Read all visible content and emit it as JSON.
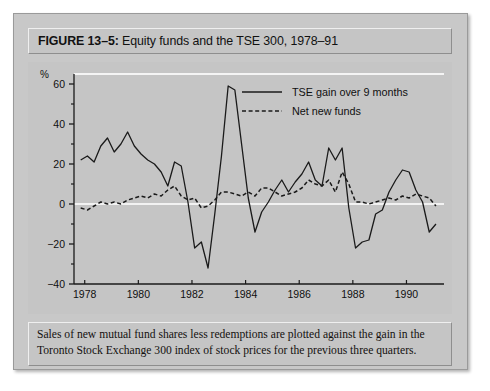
{
  "figure": {
    "label": "FIGURE 13–5:",
    "title": " Equity funds and the TSE 300, 1978–91",
    "full_title": "FIGURE 13–5: Equity funds and the TSE 300, 1978–91",
    "caption": "Sales of new mutual fund shares less redemptions are plotted against the gain in the Toronto Stock Exchange 300 index of stock prices for the previous three quarters."
  },
  "colors": {
    "panel_background": "#c8c8c8",
    "plot_background": "#c5c5c5",
    "line": "#1a1a1a",
    "zero_line": "#f2f2f2",
    "text": "#111111"
  },
  "chart_data": {
    "type": "line",
    "title": "Equity funds and the TSE 300, 1978–91",
    "xlabel": "",
    "ylabel": "%",
    "unit_label": "%",
    "xlim": [
      1977.6,
      1991.4
    ],
    "ylim": [
      -40,
      65
    ],
    "yticks": [
      -40,
      -20,
      0,
      20,
      40,
      60
    ],
    "ytick_labels": [
      "-40",
      "-20",
      "0",
      "20",
      "40",
      "60"
    ],
    "yminor_ticks": [
      -30,
      -10,
      10,
      30,
      50
    ],
    "xticks": [
      1978,
      1980,
      1982,
      1984,
      1986,
      1988,
      1990
    ],
    "xtick_labels": [
      "1978",
      "1980",
      "1982",
      "1984",
      "1986",
      "1988",
      "1990"
    ],
    "grid": false,
    "zero_line": true,
    "legend_position": "top-right",
    "series": [
      {
        "name": "TSE  gain over 9 months",
        "style": "solid",
        "x": [
          1977.85,
          1978.1,
          1978.35,
          1978.6,
          1978.85,
          1979.1,
          1979.35,
          1979.6,
          1979.85,
          1980.1,
          1980.35,
          1980.6,
          1980.85,
          1981.1,
          1981.35,
          1981.6,
          1981.85,
          1982.1,
          1982.35,
          1982.6,
          1982.85,
          1983.1,
          1983.35,
          1983.6,
          1983.85,
          1984.1,
          1984.35,
          1984.6,
          1984.85,
          1985.1,
          1985.35,
          1985.6,
          1985.85,
          1986.1,
          1986.35,
          1986.6,
          1986.85,
          1987.1,
          1987.35,
          1987.6,
          1987.85,
          1988.1,
          1988.35,
          1988.6,
          1988.85,
          1989.1,
          1989.35,
          1989.6,
          1989.85,
          1990.1,
          1990.35,
          1990.6,
          1990.85,
          1991.1
        ],
        "values": [
          22,
          24,
          21,
          29,
          33,
          26,
          30,
          36,
          29,
          25,
          22,
          20,
          16,
          9,
          21,
          19,
          1,
          -22,
          -19,
          -32,
          -5,
          24,
          59,
          57,
          30,
          3,
          -14,
          -4,
          1,
          7,
          12,
          6,
          11,
          15,
          21,
          12,
          9,
          28,
          22,
          28,
          -2,
          -22,
          -19,
          -18,
          -5,
          -3,
          6,
          12,
          17,
          16,
          7,
          1,
          -14,
          -10
        ]
      },
      {
        "name": "Net new funds",
        "style": "dashed",
        "x": [
          1977.85,
          1978.1,
          1978.35,
          1978.6,
          1978.85,
          1979.1,
          1979.35,
          1979.6,
          1979.85,
          1980.1,
          1980.35,
          1980.6,
          1980.85,
          1981.1,
          1981.35,
          1981.6,
          1981.85,
          1982.1,
          1982.35,
          1982.6,
          1982.85,
          1983.1,
          1983.35,
          1983.6,
          1983.85,
          1984.1,
          1984.35,
          1984.6,
          1984.85,
          1985.1,
          1985.35,
          1985.6,
          1985.85,
          1986.1,
          1986.35,
          1986.6,
          1986.85,
          1987.1,
          1987.35,
          1987.6,
          1987.85,
          1988.1,
          1988.35,
          1988.6,
          1988.85,
          1989.1,
          1989.35,
          1989.6,
          1989.85,
          1990.1,
          1990.35,
          1990.6,
          1990.85,
          1991.1
        ],
        "values": [
          -2,
          -3,
          -1,
          1,
          0,
          1,
          0,
          2,
          3,
          4,
          3,
          5,
          4,
          7,
          9,
          4,
          2,
          3,
          -2,
          -1,
          2,
          6,
          6,
          5,
          4,
          6,
          4,
          8,
          8,
          6,
          4,
          5,
          6,
          8,
          12,
          10,
          9,
          12,
          6,
          16,
          10,
          1,
          1,
          0,
          1,
          2,
          3,
          2,
          4,
          3,
          5,
          4,
          3,
          -1
        ]
      }
    ]
  }
}
